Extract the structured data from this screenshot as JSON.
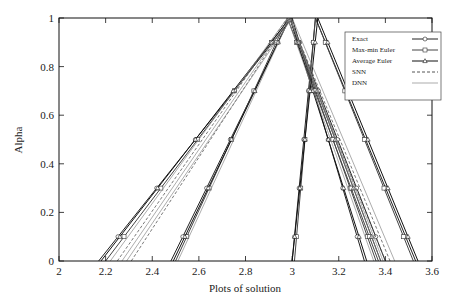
{
  "chart_data": {
    "type": "line",
    "title": "",
    "xlabel": "Plots of solution",
    "ylabel": "Alpha",
    "xlim": [
      2,
      3.6
    ],
    "ylim": [
      0,
      1
    ],
    "xticks": [
      "2",
      "2.2",
      "2.4",
      "2.6",
      "2.8",
      "3",
      "3.2",
      "3.4",
      "3.6"
    ],
    "yticks": [
      "0",
      "0.2",
      "0.4",
      "0.6",
      "0.8",
      "1"
    ],
    "grid": false,
    "legend_position": "upper right",
    "legend": [
      "Exact",
      "Max-min Euler",
      "Average Euler",
      "SNN",
      "DNN"
    ],
    "series": [
      {
        "name": "Exact",
        "marker": "circle",
        "color": "#222222",
        "triangles": [
          [
            2.17,
            3.0,
            3.31
          ],
          [
            2.48,
            2.99,
            3.4
          ],
          [
            3.0,
            3.1,
            3.53
          ]
        ]
      },
      {
        "name": "Max-min Euler",
        "marker": "square",
        "color": "#444444",
        "triangles": [
          [
            2.2,
            2.99,
            3.36
          ],
          [
            2.5,
            2.98,
            3.37
          ],
          [
            3.01,
            3.1,
            3.52
          ]
        ]
      },
      {
        "name": "Average Euler",
        "marker": "triangle",
        "color": "#111111",
        "triangles": [
          [
            2.18,
            2.99,
            3.32
          ],
          [
            2.49,
            2.99,
            3.38
          ],
          [
            3.0,
            3.11,
            3.54
          ]
        ]
      },
      {
        "name": "SNN",
        "marker": "none",
        "dash": "dashed",
        "color": "#555555",
        "triangles": [
          [
            2.25,
            2.98,
            3.4
          ],
          [
            2.31,
            2.99,
            3.42
          ]
        ]
      },
      {
        "name": "DNN",
        "marker": "none",
        "dash": "solid",
        "color": "#888888",
        "triangles": [
          [
            2.22,
            2.98,
            3.35
          ],
          [
            2.27,
            2.99,
            3.38
          ],
          [
            2.29,
            3.0,
            3.44
          ],
          [
            2.51,
            2.99,
            3.39
          ]
        ]
      }
    ]
  },
  "axes": {
    "xlabel": "Plots of solution",
    "ylabel": "Alpha"
  },
  "legend": {
    "items": [
      {
        "label": "Exact"
      },
      {
        "label": "Max-min Euler"
      },
      {
        "label": "Average Euler"
      },
      {
        "label": "SNN"
      },
      {
        "label": "DNN"
      }
    ]
  }
}
